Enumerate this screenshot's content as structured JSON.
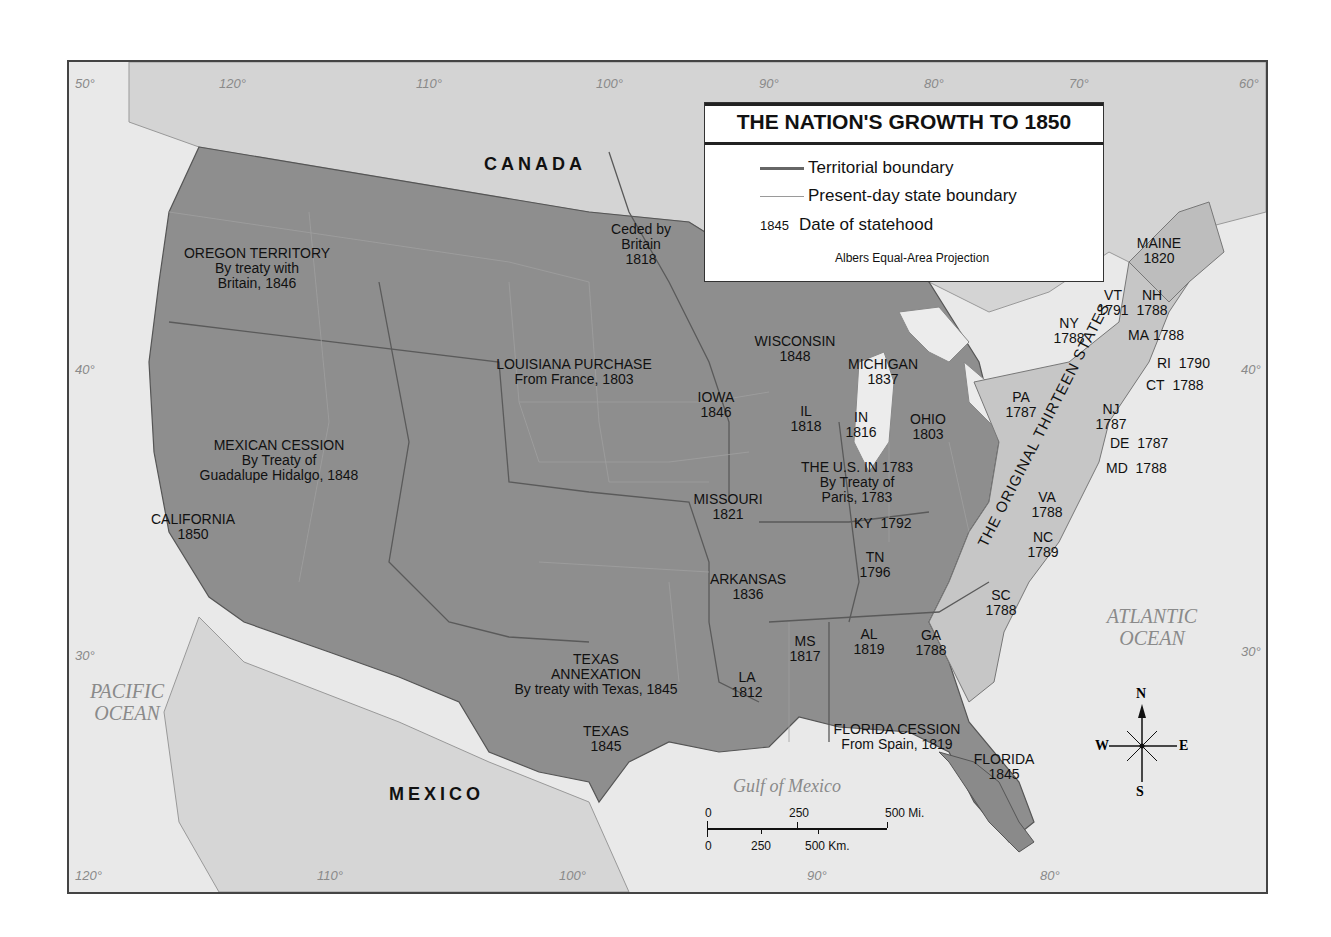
{
  "legend": {
    "title": "THE NATION'S GROWTH TO 1850",
    "items": [
      {
        "symbol": "territorial-boundary-line",
        "label": "Territorial boundary",
        "color": "#666666"
      },
      {
        "symbol": "state-boundary-line",
        "label": "Present-day state boundary",
        "color": "#9a9a9a"
      },
      {
        "symbol": "1845",
        "label": "Date of statehood"
      }
    ],
    "projection": "Albers Equal-Area Projection"
  },
  "countries": {
    "canada": "CANADA",
    "mexico": "MEXICO"
  },
  "oceans": {
    "pacific": [
      "PACIFIC",
      "OCEAN"
    ],
    "atlantic": [
      "ATLANTIC",
      "OCEAN"
    ],
    "gulf": "Gulf of Mexico"
  },
  "territories": {
    "oregon": [
      "OREGON TERRITORY",
      "By treaty with",
      "Britain, 1846"
    ],
    "louisiana": [
      "LOUISIANA PURCHASE",
      "From France, 1803"
    ],
    "mexican_cession": [
      "MEXICAN CESSION",
      "By Treaty of",
      "Guadalupe Hidalgo, 1848"
    ],
    "texas_annexation": [
      "TEXAS",
      "ANNEXATION",
      "By treaty with Texas, 1845"
    ],
    "florida_cession": [
      "FLORIDA CESSION",
      "From Spain, 1819"
    ],
    "us_1783": [
      "THE U.S. IN 1783",
      "By Treaty of",
      "Paris, 1783"
    ],
    "ceded_britain": [
      "Ceded by",
      "Britain",
      "1818"
    ],
    "original_thirteen": "THE ORIGINAL THIRTEEN STATES"
  },
  "states": [
    {
      "name": "CALIFORNIA",
      "year": "1850"
    },
    {
      "name": "TEXAS",
      "year": "1845"
    },
    {
      "name": "IOWA",
      "year": "1846"
    },
    {
      "name": "MISSOURI",
      "year": "1821"
    },
    {
      "name": "ARKANSAS",
      "year": "1836"
    },
    {
      "name": "LA",
      "year": "1812"
    },
    {
      "name": "WISCONSIN",
      "year": "1848"
    },
    {
      "name": "MICHIGAN",
      "year": "1837"
    },
    {
      "name": "IL",
      "year": "1818"
    },
    {
      "name": "IN",
      "year": "1816"
    },
    {
      "name": "OHIO",
      "year": "1803"
    },
    {
      "name": "KY",
      "year": "1792"
    },
    {
      "name": "TN",
      "year": "1796"
    },
    {
      "name": "MS",
      "year": "1817"
    },
    {
      "name": "AL",
      "year": "1819"
    },
    {
      "name": "FLORIDA",
      "year": "1845"
    },
    {
      "name": "GA",
      "year": "1788"
    },
    {
      "name": "SC",
      "year": "1788"
    },
    {
      "name": "NC",
      "year": "1789"
    },
    {
      "name": "VA",
      "year": "1788"
    },
    {
      "name": "PA",
      "year": "1787"
    },
    {
      "name": "NY",
      "year": "1788"
    },
    {
      "name": "NJ",
      "year": "1787"
    },
    {
      "name": "DE",
      "year": "1787"
    },
    {
      "name": "MD",
      "year": "1788"
    },
    {
      "name": "CT",
      "year": "1788"
    },
    {
      "name": "RI",
      "year": "1790"
    },
    {
      "name": "MA",
      "year": "1788"
    },
    {
      "name": "VT",
      "year": "1791"
    },
    {
      "name": "NH",
      "year": "1788"
    },
    {
      "name": "MAINE",
      "year": "1820"
    }
  ],
  "graticule": {
    "top": [
      "50°",
      "120°",
      "110°",
      "100°",
      "90°",
      "80°",
      "70°",
      "60°"
    ],
    "left": [
      "40°",
      "30°"
    ],
    "right": [
      "40°",
      "30°"
    ],
    "bottom": [
      "120°",
      "110°",
      "100°",
      "90°",
      "80°"
    ]
  },
  "scale": {
    "miles": [
      "0",
      "250",
      "500 Mi."
    ],
    "km": [
      "0",
      "250",
      "500 Km."
    ]
  },
  "compass": {
    "n": "N",
    "s": "S",
    "e": "E",
    "w": "W"
  },
  "colors": {
    "acquired_territory": "#8c8c8c",
    "original_states": "#c4c4c4",
    "foreign_land": "#d6d6d6",
    "water": "#e9e9e9"
  }
}
